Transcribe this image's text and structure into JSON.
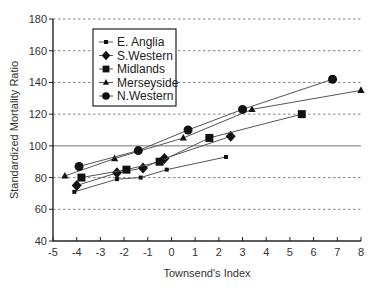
{
  "chart_data": {
    "type": "line",
    "title": "",
    "xlabel": "Townsend's Index",
    "ylabel": "Standardized Mortality Ratio",
    "xlim": [
      -5,
      8
    ],
    "ylim": [
      40,
      180
    ],
    "xticks": [
      -5,
      -4,
      -3,
      -2,
      -1,
      0,
      1,
      2,
      3,
      4,
      5,
      6,
      7,
      8
    ],
    "yticks": [
      40,
      60,
      80,
      100,
      120,
      140,
      160,
      180
    ],
    "grid": "horizontal dashed",
    "reference_line": 100,
    "legend_position": "upper left",
    "series": [
      {
        "name": "E. Anglia",
        "marker": "small-square",
        "x": [
          -4.1,
          -2.3,
          -1.3,
          -0.2,
          2.3
        ],
        "y": [
          71,
          79,
          80,
          85,
          93
        ]
      },
      {
        "name": "S.Western",
        "marker": "diamond",
        "x": [
          -4.0,
          -2.3,
          -1.2,
          -0.3,
          2.5
        ],
        "y": [
          75,
          83,
          86,
          92,
          106
        ]
      },
      {
        "name": "Midlands",
        "marker": "square",
        "x": [
          -3.8,
          -1.9,
          -0.5,
          1.6,
          5.5
        ],
        "y": [
          80,
          85,
          90,
          105,
          120
        ]
      },
      {
        "name": "Merseyside",
        "marker": "triangle",
        "x": [
          -4.5,
          -2.4,
          0.5,
          3.4,
          8.0
        ],
        "y": [
          81,
          92,
          105,
          123,
          135
        ]
      },
      {
        "name": "N.Western",
        "marker": "circle",
        "x": [
          -3.9,
          -1.4,
          0.7,
          3.0,
          6.8
        ],
        "y": [
          87,
          97,
          110,
          123,
          142
        ]
      }
    ]
  },
  "colors": {
    "line": "#555555",
    "marker": "#111111",
    "grid": "#666666",
    "axis": "#222222"
  }
}
